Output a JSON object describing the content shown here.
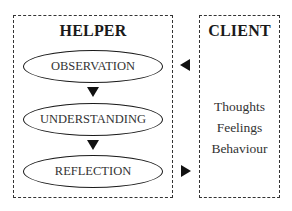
{
  "helper": {
    "title": "HELPER",
    "steps": [
      {
        "label": "OBSERVATION"
      },
      {
        "label": "UNDERSTANDING"
      },
      {
        "label": "REFLECTION"
      }
    ]
  },
  "client": {
    "title": "CLIENT",
    "items": [
      "Thoughts",
      "Feelings",
      "Behaviour"
    ]
  },
  "arrows": {
    "client_to_helper": "arrow pointing left from Client to Helper at Observation level",
    "helper_to_client": "arrow pointing right from Helper to Client at Reflection level",
    "step_flow": "downward arrows between helper steps"
  },
  "colors": {
    "line": "#333333",
    "arrow": "#111111",
    "background": "#ffffff"
  }
}
